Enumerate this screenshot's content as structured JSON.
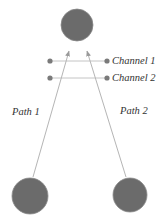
{
  "diagram": {
    "colors": {
      "node_fill": "#6b6b6b",
      "node_stroke": "#8a8a8a",
      "path_line": "#b5b5b5",
      "channel_line": "#c4c4c4",
      "channel_dot": "#7a7a7a",
      "text": "#333333"
    },
    "nodes": {
      "receiver": {
        "cx": 77,
        "cy": 25,
        "r": 16
      },
      "source_left": {
        "cx": 30,
        "cy": 196,
        "r": 18
      },
      "source_right": {
        "cx": 130,
        "cy": 195,
        "r": 17
      }
    },
    "paths": [
      {
        "label": "Path 1",
        "x1": 33,
        "y1": 177,
        "x2": 69,
        "y2": 51,
        "label_x": 12,
        "label_y": 115
      },
      {
        "label": "Path 2",
        "x1": 126,
        "y1": 177,
        "x2": 87,
        "y2": 51,
        "label_x": 120,
        "label_y": 114
      }
    ],
    "channels": [
      {
        "label": "Channel 1",
        "y": 61,
        "x1": 50,
        "x2": 107,
        "label_x": 112,
        "label_y": 64
      },
      {
        "label": "Channel 2",
        "y": 78,
        "x1": 50,
        "x2": 107,
        "label_x": 112,
        "label_y": 81
      }
    ]
  }
}
